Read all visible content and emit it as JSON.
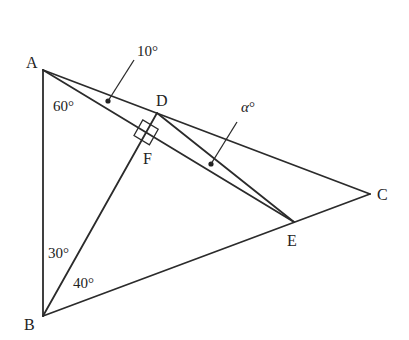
{
  "diagram": {
    "points": {
      "A": {
        "label": "A",
        "x": 43,
        "y": 70
      },
      "B": {
        "label": "B",
        "x": 43,
        "y": 316
      },
      "C": {
        "label": "C",
        "x": 370,
        "y": 194
      },
      "D": {
        "label": "D",
        "x": 157,
        "y": 113
      },
      "E": {
        "label": "E",
        "x": 294,
        "y": 222
      },
      "F": {
        "label": "F",
        "x": 146,
        "y": 132
      }
    },
    "segments": [
      "AB",
      "AC",
      "BC",
      "AE",
      "BD",
      "DE"
    ],
    "right_angle_at": "F",
    "angles": {
      "BAE": "60°",
      "CAE": "10°",
      "ABD": "30°",
      "DBC": "40°",
      "unknown": "α°"
    },
    "labels": {
      "A": "A",
      "B": "B",
      "C": "C",
      "D": "D",
      "E": "E",
      "F": "F",
      "angle_60": "60°",
      "angle_10": "10°",
      "angle_30": "30°",
      "angle_40": "40°",
      "angle_alpha_symbol": "α",
      "angle_alpha_degree": "°"
    },
    "colors": {
      "stroke": "#2b2b2b",
      "text": "#222222",
      "background": "#ffffff"
    }
  }
}
